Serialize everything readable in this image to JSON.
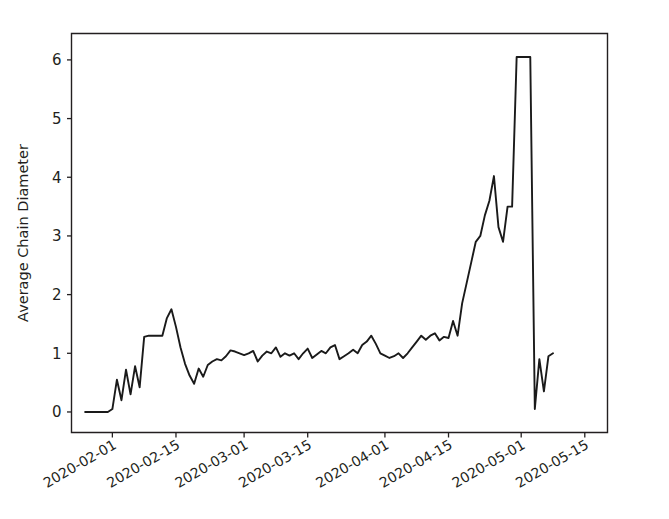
{
  "chart_data": {
    "type": "line",
    "title": "",
    "xlabel": "",
    "ylabel": "Average Chain Diameter",
    "ylim": [
      -0.35,
      6.45
    ],
    "yticks": [
      0,
      1,
      2,
      3,
      4,
      5,
      6
    ],
    "ytick_labels": [
      "0",
      "1",
      "2",
      "3",
      "4",
      "5",
      "6"
    ],
    "xlim": [
      "2020-01-23",
      "2020-05-20"
    ],
    "xticks": [
      "2020-02-01",
      "2020-02-15",
      "2020-03-01",
      "2020-03-15",
      "2020-04-01",
      "2020-04-15",
      "2020-05-01",
      "2020-05-15"
    ],
    "xtick_labels": [
      "2020-02-01",
      "2020-02-15",
      "2020-03-01",
      "2020-03-15",
      "2020-04-01",
      "2020-04-15",
      "2020-05-01",
      "2020-05-15"
    ],
    "grid": false,
    "legend": "none",
    "line_color": "#1a1a1a",
    "background_color": "#ffffff",
    "series": [
      {
        "name": "Average Chain Diameter",
        "x": [
          "2020-01-26",
          "2020-01-27",
          "2020-01-28",
          "2020-01-29",
          "2020-01-30",
          "2020-01-31",
          "2020-02-01",
          "2020-02-02",
          "2020-02-03",
          "2020-02-04",
          "2020-02-05",
          "2020-02-06",
          "2020-02-07",
          "2020-02-08",
          "2020-02-09",
          "2020-02-10",
          "2020-02-11",
          "2020-02-12",
          "2020-02-13",
          "2020-02-14",
          "2020-02-15",
          "2020-02-16",
          "2020-02-17",
          "2020-02-18",
          "2020-02-19",
          "2020-02-20",
          "2020-02-21",
          "2020-02-22",
          "2020-02-23",
          "2020-02-24",
          "2020-02-25",
          "2020-02-26",
          "2020-02-27",
          "2020-02-28",
          "2020-02-29",
          "2020-03-01",
          "2020-03-02",
          "2020-03-03",
          "2020-03-04",
          "2020-03-05",
          "2020-03-06",
          "2020-03-07",
          "2020-03-08",
          "2020-03-09",
          "2020-03-10",
          "2020-03-11",
          "2020-03-12",
          "2020-03-13",
          "2020-03-14",
          "2020-03-15",
          "2020-03-16",
          "2020-03-17",
          "2020-03-18",
          "2020-03-19",
          "2020-03-20",
          "2020-03-21",
          "2020-03-22",
          "2020-03-23",
          "2020-03-24",
          "2020-03-25",
          "2020-03-26",
          "2020-03-27",
          "2020-03-28",
          "2020-03-29",
          "2020-03-30",
          "2020-03-31",
          "2020-04-01",
          "2020-04-02",
          "2020-04-03",
          "2020-04-04",
          "2020-04-05",
          "2020-04-06",
          "2020-04-07",
          "2020-04-08",
          "2020-04-09",
          "2020-04-10",
          "2020-04-11",
          "2020-04-12",
          "2020-04-13",
          "2020-04-14",
          "2020-04-15",
          "2020-04-16",
          "2020-04-17",
          "2020-04-18",
          "2020-04-19",
          "2020-04-20",
          "2020-04-21",
          "2020-04-22",
          "2020-04-23",
          "2020-04-24",
          "2020-04-25",
          "2020-04-26",
          "2020-04-27",
          "2020-04-28",
          "2020-04-29",
          "2020-04-30",
          "2020-05-01",
          "2020-05-02",
          "2020-05-03",
          "2020-05-04",
          "2020-05-05",
          "2020-05-06",
          "2020-05-07",
          "2020-05-08"
        ],
        "values": [
          0.0,
          0.0,
          0.0,
          0.0,
          0.0,
          0.0,
          0.05,
          0.55,
          0.2,
          0.72,
          0.3,
          0.78,
          0.42,
          1.28,
          1.3,
          1.3,
          1.3,
          1.3,
          1.6,
          1.75,
          1.45,
          1.1,
          0.82,
          0.62,
          0.48,
          0.74,
          0.6,
          0.8,
          0.86,
          0.9,
          0.88,
          0.95,
          1.05,
          1.03,
          1.0,
          0.97,
          1.0,
          1.04,
          0.86,
          0.96,
          1.03,
          1.0,
          1.1,
          0.94,
          1.0,
          0.96,
          1.0,
          0.9,
          1.0,
          1.08,
          0.92,
          0.98,
          1.04,
          1.0,
          1.1,
          1.14,
          0.9,
          0.95,
          1.0,
          1.06,
          1.0,
          1.14,
          1.2,
          1.3,
          1.16,
          1.0,
          0.96,
          0.92,
          0.95,
          1.0,
          0.92,
          1.0,
          1.1,
          1.2,
          1.3,
          1.23,
          1.3,
          1.34,
          1.22,
          1.28,
          1.26,
          1.55,
          1.3,
          1.85,
          2.2,
          2.55,
          2.9,
          3.0,
          3.35,
          3.6,
          4.02,
          3.15,
          2.9,
          3.5,
          3.5,
          6.05,
          6.05,
          6.05,
          6.05,
          0.05,
          0.9,
          0.35,
          0.95,
          1.0
        ]
      }
    ]
  },
  "axes": {
    "ylabel": "Average Chain Diameter"
  }
}
